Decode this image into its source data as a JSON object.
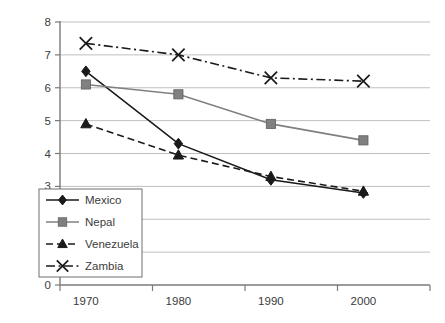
{
  "chart_data": {
    "type": "line",
    "title": "",
    "xlabel": "",
    "ylabel": "",
    "categories": [
      "1970",
      "1980",
      "1990",
      "2000"
    ],
    "ylim": [
      0,
      8
    ],
    "ytick_step": 1,
    "yticks": [
      "0",
      "1",
      "2",
      "3",
      "4",
      "5",
      "6",
      "7",
      "8"
    ],
    "grid": "horizontal",
    "legend_position": "inside-lower-left",
    "series": [
      {
        "name": "Mexico",
        "values": [
          6.5,
          4.3,
          3.2,
          2.8
        ],
        "color": "#1a1a1a",
        "line_style": "solid",
        "marker": "diamond"
      },
      {
        "name": "Nepal",
        "values": [
          6.1,
          5.8,
          4.9,
          4.4
        ],
        "color": "#808080",
        "line_style": "solid",
        "marker": "square"
      },
      {
        "name": "Venezuela",
        "values": [
          4.9,
          3.95,
          3.3,
          2.85
        ],
        "color": "#1a1a1a",
        "line_style": "dashed",
        "marker": "triangle"
      },
      {
        "name": "Zambia",
        "values": [
          7.35,
          7.0,
          6.3,
          6.2
        ],
        "color": "#1a1a1a",
        "line_style": "dashdot",
        "marker": "x"
      }
    ]
  },
  "axis": {
    "y_tick_labels": [
      "8",
      "7",
      "6",
      "5",
      "4",
      "3",
      "2",
      "1",
      "0"
    ],
    "x_tick_labels": [
      "1970",
      "1980",
      "1990",
      "2000"
    ]
  },
  "legend": {
    "items": [
      {
        "label": "Mexico"
      },
      {
        "label": "Nepal"
      },
      {
        "label": "Venezuela"
      },
      {
        "label": "Zambia"
      }
    ]
  },
  "caption": {
    "cut_off_text": ""
  }
}
